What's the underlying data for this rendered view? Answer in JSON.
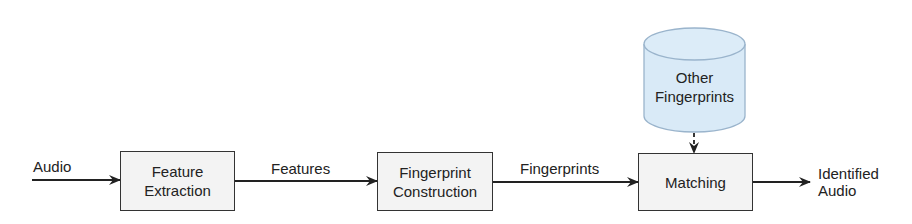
{
  "diagram": {
    "type": "flowchart",
    "nodes": {
      "feature_extraction": {
        "line1": "Feature",
        "line2": "Extraction"
      },
      "fingerprint_construction": {
        "line1": "Fingerprint",
        "line2": "Construction"
      },
      "matching": {
        "label": "Matching"
      },
      "database": {
        "line1": "Other",
        "line2": "Fingerprints",
        "shape": "cylinder",
        "fill": "#d9eaf7"
      }
    },
    "edges": {
      "input": "Audio",
      "features": "Features",
      "fingerprints": "Fingerprints",
      "output_line1": "Identified",
      "output_line2": "Audio"
    },
    "colors": {
      "box_fill": "#f3f3f3",
      "stroke": "#333333",
      "db_fill": "#d9eaf7",
      "db_stroke": "#9ab4cc"
    }
  }
}
